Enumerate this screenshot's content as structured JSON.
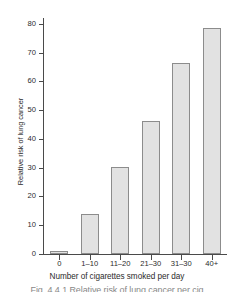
{
  "chart_data": {
    "type": "bar",
    "title": "",
    "xlabel": "Number of cigarettes smoked per day",
    "ylabel": "Relative risk of lung cancer",
    "categories": [
      "0",
      "1–10",
      "11–20",
      "21–30",
      "31–30",
      "40+"
    ],
    "values": [
      1,
      13.8,
      30.3,
      46.3,
      66.5,
      78.5
    ],
    "ylim": [
      0,
      82
    ],
    "yticks": [
      0,
      10,
      20,
      30,
      40,
      50,
      60,
      70,
      80
    ],
    "ytick_labels": [
      "0",
      "10",
      "20",
      "30",
      "40",
      "50",
      "60",
      "70",
      "80"
    ],
    "grid": false,
    "legend": false,
    "bar_fill": "#e2e2e2",
    "bar_edge": "#8c8c8c",
    "axis_color": "#4a4a4a"
  },
  "caption": {
    "text": "Fig. 4.4.1  Relative risk of lung cancer per cig"
  }
}
